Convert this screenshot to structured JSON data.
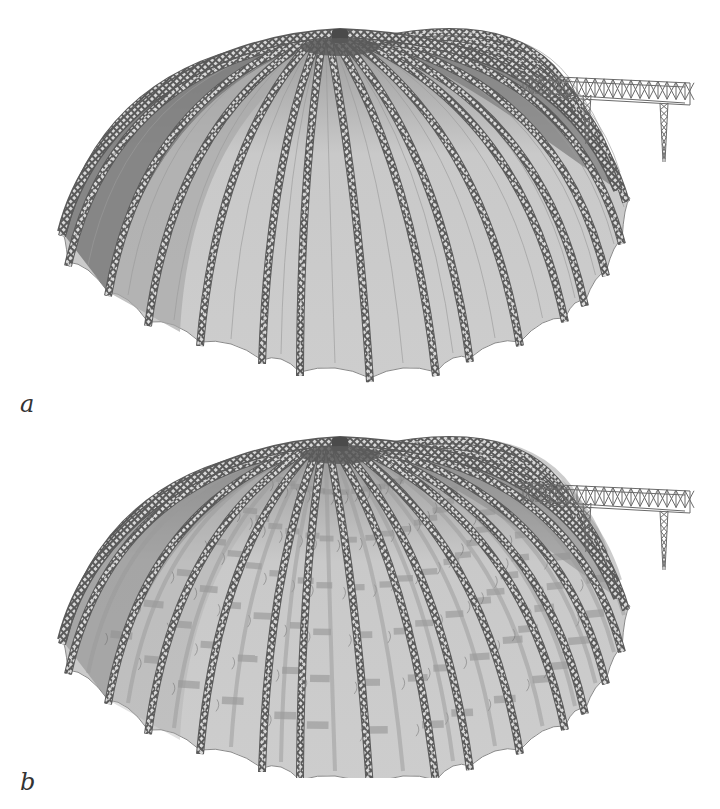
{
  "figure": {
    "panels": [
      {
        "id": "a",
        "label": "a",
        "description": "Dome membrane roof with lattice truss ribs and attached gantry crane truss - smooth membrane state",
        "state": "smooth"
      },
      {
        "id": "b",
        "label": "b",
        "description": "Dome membrane roof with lattice truss ribs and attached gantry crane truss - wrinkled / deformed membrane state",
        "state": "wrinkled"
      }
    ],
    "dome": {
      "rib_count": 19,
      "apex": [
        340,
        33
      ],
      "rim_left": [
        60,
        232
      ],
      "rim_right": [
        622,
        192
      ],
      "bottom_center_y": 378
    },
    "colors": {
      "membrane_light": "#c9c9c9",
      "membrane_mid": "#a8a8a8",
      "membrane_dark": "#7a7a7a",
      "rib": "#5a5a5a",
      "rib_highlight": "#e6e6e6",
      "background": "#ffffff",
      "label": "#333333"
    }
  }
}
